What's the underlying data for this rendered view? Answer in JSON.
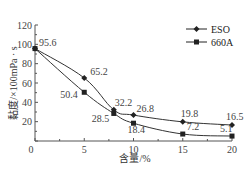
{
  "chart_data": {
    "type": "line",
    "title": "",
    "xlabel": "含量/%",
    "ylabel": "黏度/×100mPa · s",
    "x": [
      0,
      5,
      8,
      10,
      15,
      20
    ],
    "xlim": [
      0,
      20
    ],
    "ylim": [
      0,
      120
    ],
    "xticks": [
      "0",
      "5",
      "10",
      "15",
      "20"
    ],
    "yticks": [
      "20",
      "40",
      "60",
      "80",
      "100",
      "120"
    ],
    "legend_position": "upper right",
    "grid": false,
    "series": [
      {
        "name": "ESO",
        "marker": "diamond",
        "x": [
          0,
          5,
          8,
          10,
          15,
          20
        ],
        "values": [
          95.6,
          65.2,
          32.2,
          26.8,
          19.8,
          16.5
        ],
        "labels": [
          "95.6",
          "65.2",
          "32.2",
          "26.8",
          "19.8",
          "16.5"
        ]
      },
      {
        "name": "660A",
        "marker": "square",
        "x": [
          0,
          5,
          8,
          10,
          15,
          20
        ],
        "values": [
          95.6,
          50.4,
          28.5,
          18.4,
          7.2,
          5.1
        ],
        "labels": [
          "",
          "50.4",
          "28.5",
          "18.4",
          "7.2",
          "5.1"
        ]
      }
    ]
  },
  "axis": {
    "origin_label": "0",
    "x_label": "含量/%",
    "y_label": "黏度/×100mPa · s"
  },
  "legend": {
    "items": [
      {
        "label": "ESO"
      },
      {
        "label": "660A"
      }
    ]
  }
}
